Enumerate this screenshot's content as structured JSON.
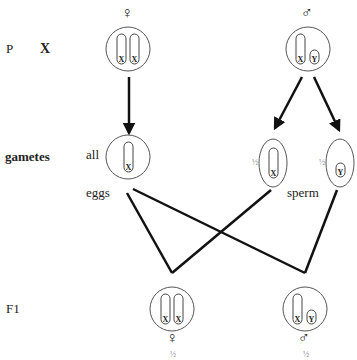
{
  "rows": {
    "parents_label": "P",
    "cross_symbol": "X",
    "gametes_label": "gametes",
    "offspring_label": "F1"
  },
  "parents": {
    "female": {
      "symbol": "♀",
      "chromosomes": [
        "X",
        "X"
      ]
    },
    "male": {
      "symbol": "♂",
      "chromosomes": [
        "X",
        "Y"
      ]
    }
  },
  "gametes": {
    "egg": {
      "prefix": "all",
      "caption": "eggs",
      "chromosome": "X"
    },
    "sperm_x": {
      "fraction": "½",
      "chromosome": "X"
    },
    "sperm_y": {
      "fraction": "½",
      "chromosome": "Y"
    },
    "sperm_caption": "sperm"
  },
  "offspring": {
    "female": {
      "symbol": "♀",
      "chromosomes": [
        "X",
        "X"
      ],
      "fraction": "½"
    },
    "male": {
      "symbol": "♂",
      "chromosomes": [
        "X",
        "Y"
      ],
      "fraction": "½"
    }
  },
  "colors": {
    "line": "#111111",
    "outline": "#444444"
  }
}
